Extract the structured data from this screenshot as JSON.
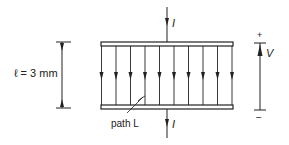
{
  "figure": {
    "type": "parallel-plate-capacitor",
    "dimension_label": "ℓ = 3 mm",
    "current_label_top": "I",
    "current_label_bottom": "I",
    "voltage_label": "V",
    "voltage_plus": "+",
    "voltage_minus": "−",
    "path_label": "path L",
    "field_line_count": 10,
    "colors": {
      "ink": "#222222",
      "background": "#ffffff"
    }
  }
}
